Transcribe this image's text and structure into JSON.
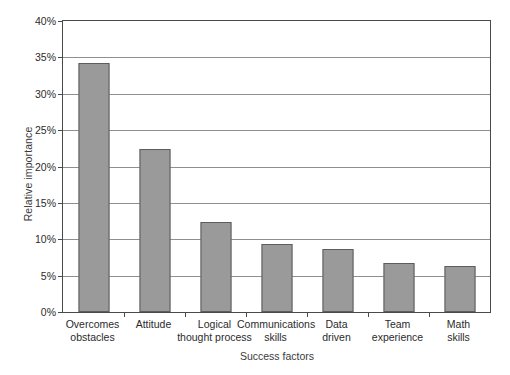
{
  "chart_data": {
    "type": "bar",
    "title": "",
    "xlabel": "Success factors",
    "ylabel": "Relative importance",
    "categories": [
      "Overcomes obstacles",
      "Attitude",
      "Logical thought process",
      "Communications skills",
      "Data driven",
      "Team experience",
      "Math skills"
    ],
    "category_lines": [
      [
        "Overcomes",
        "obstacles"
      ],
      [
        "Attitude",
        ""
      ],
      [
        "Logical",
        "thought process"
      ],
      [
        "Communications",
        "skills"
      ],
      [
        "Data",
        "driven"
      ],
      [
        "Team",
        "experience"
      ],
      [
        "Math",
        "skills"
      ]
    ],
    "values": [
      34.2,
      22.4,
      12.4,
      9.4,
      8.6,
      6.7,
      6.3
    ],
    "value_unit": "%",
    "ylim": [
      0,
      40
    ],
    "ytick_values": [
      0,
      5,
      10,
      15,
      20,
      25,
      30,
      35,
      40
    ],
    "ytick_labels": [
      "0%",
      "5%",
      "10%",
      "15%",
      "20%",
      "25%",
      "30%",
      "35%",
      "40%"
    ],
    "grid": "horizontal",
    "legend": "none",
    "bar_color": "#9a9a9a",
    "bar_border_color": "#5d5d5d",
    "gridline_color": "#8f8f8f",
    "axis_color": "#4a4a4a"
  }
}
